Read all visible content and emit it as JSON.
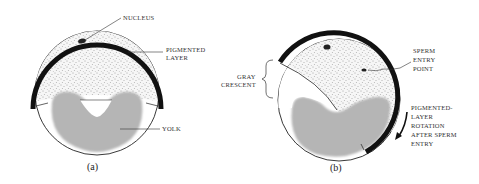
{
  "figure": {
    "panel_a": {
      "caption": "(a)",
      "labels": {
        "nucleus": "NUCLEUS",
        "pigmented_layer_line1": "PIGMENTED",
        "pigmented_layer_line2": "LAYER",
        "yolk": "YOLK"
      }
    },
    "panel_b": {
      "caption": "(b)",
      "labels": {
        "gray_crescent_line1": "GRAY",
        "gray_crescent_line2": "CRESCENT",
        "sperm_entry_line1": "SPERM",
        "sperm_entry_line2": "ENTRY",
        "sperm_entry_line3": "POINT",
        "rotation_line1": "PIGMENTED-",
        "rotation_line2": "LAYER",
        "rotation_line3": "ROTATION",
        "rotation_line4": "AFTER SPERM",
        "rotation_line5": "ENTRY"
      }
    },
    "colors": {
      "pigment_band": "#111111",
      "stipple_bg": "#f4f4f4",
      "stipple_dot": "#555555",
      "yolk": "#b5b5b5",
      "outline": "#222222"
    }
  }
}
